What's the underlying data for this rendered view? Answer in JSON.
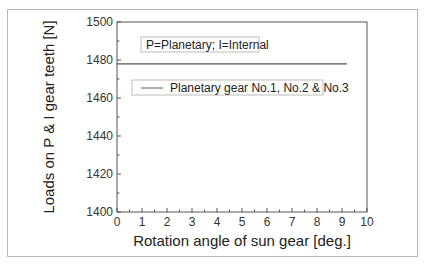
{
  "chart_data": {
    "type": "line",
    "title": "",
    "xlabel": "Rotation angle of sun gear [deg.]",
    "ylabel": "Loads on P & I gear teeth [N]",
    "xlim": [
      0,
      10
    ],
    "ylim": [
      1400,
      1500
    ],
    "x_ticks": [
      "0",
      "1",
      "2",
      "3",
      "4",
      "5",
      "6",
      "7",
      "8",
      "9",
      "10"
    ],
    "y_ticks": [
      "1400",
      "1420",
      "1440",
      "1460",
      "1480",
      "1500"
    ],
    "grid": false,
    "annotation": "P=Planetary; I=Internal",
    "legend": [
      "Planetary gear No.1, No.2 & No.3"
    ],
    "legend_position": "upper-left inside",
    "series": [
      {
        "name": "Planetary gear No.1, No.2 & No.3",
        "x": [
          0,
          9.2
        ],
        "values": [
          1478,
          1478
        ],
        "color": "#555555"
      }
    ]
  }
}
